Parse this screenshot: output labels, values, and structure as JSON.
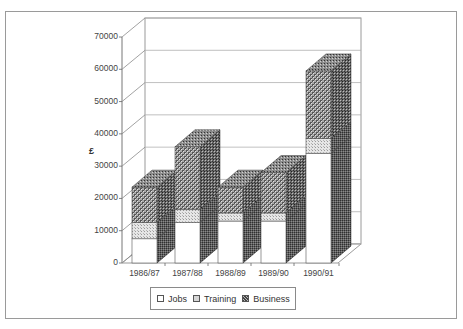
{
  "chart_data": {
    "type": "bar",
    "subtype": "stacked-3d",
    "title": "",
    "xlabel": "",
    "ylabel": "£",
    "ylim": [
      0,
      70000
    ],
    "yticks": [
      0,
      10000,
      20000,
      30000,
      40000,
      50000,
      60000,
      70000
    ],
    "ytick_labels": [
      "0",
      "10000",
      "20000",
      "30000",
      "40000",
      "50000",
      "60000",
      "70000"
    ],
    "grid": true,
    "legend_position": "bottom",
    "categories": [
      "1986/87",
      "1987/88",
      "1988/89",
      "1989/90",
      "1990/91"
    ],
    "series": [
      {
        "name": "Jobs",
        "values": [
          7500,
          12500,
          13000,
          13000,
          34000
        ],
        "fill": "#ffffff"
      },
      {
        "name": "Training",
        "values": [
          5000,
          4000,
          2500,
          2500,
          4500
        ],
        "fill": "#d4d4d4"
      },
      {
        "name": "Business",
        "values": [
          11000,
          19500,
          8000,
          12500,
          21000
        ],
        "fill": "#7a7a7a"
      }
    ]
  },
  "legend": {
    "items": [
      {
        "label": "Jobs"
      },
      {
        "label": "Training"
      },
      {
        "label": "Business"
      }
    ]
  }
}
